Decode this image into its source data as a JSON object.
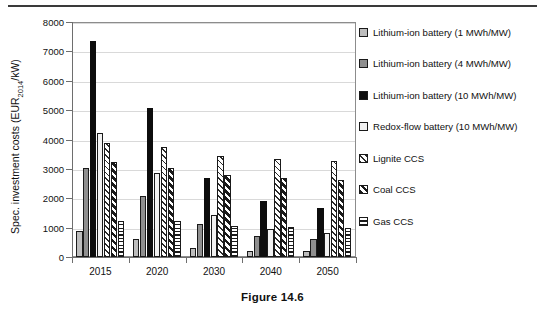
{
  "figure": {
    "caption": "Figure 14.6"
  },
  "chart_data": {
    "type": "bar",
    "title": "",
    "xlabel": "",
    "ylabel": "Spec. investment costs (EUR2014/kW)",
    "ylabel_prefix": "Spec. investment costs (EUR",
    "ylabel_sub": "2014",
    "ylabel_suffix": "/kW)",
    "ylim": [
      0,
      8000
    ],
    "ytick_step": 1000,
    "yticks": [
      "0",
      "1000",
      "2000",
      "3000",
      "4000",
      "5000",
      "6000",
      "7000",
      "8000"
    ],
    "grid": true,
    "legend_position": "right",
    "categories": [
      "2015",
      "2020",
      "2030",
      "2040",
      "2050"
    ],
    "series": [
      {
        "name": "Lithium-ion battery (1 MWh/MW)",
        "swatch": "light-gray-solid",
        "color": "#bdbdbd",
        "values": [
          880,
          610,
          320,
          215,
          190
        ]
      },
      {
        "name": "Lithium-ion battery (4 MWh/MW)",
        "swatch": "mid-gray-solid",
        "color": "#8f8f8f",
        "values": [
          3030,
          2090,
          1110,
          700,
          610
        ]
      },
      {
        "name": "Lithium-ion battery (10 MWh/MW)",
        "swatch": "black-solid",
        "color": "#0d0d0d",
        "values": [
          7360,
          5080,
          2680,
          1910,
          1680
        ]
      },
      {
        "name": "Redox-flow battery (10 MWh/MW)",
        "swatch": "white-solid",
        "color": "#f2f2f2",
        "values": [
          4220,
          2860,
          1430,
          940,
          830
        ]
      },
      {
        "name": "Lignite CCS",
        "swatch": "diagonal-light-hatch",
        "color": "#2b2b2b",
        "values": [
          3890,
          3750,
          3450,
          3340,
          3270
        ]
      },
      {
        "name": "Coal CCS",
        "swatch": "diagonal-dark-hatch",
        "color": "#1a1a1a",
        "values": [
          3250,
          3030,
          2780,
          2700,
          2630
        ]
      },
      {
        "name": "Gas CCS",
        "swatch": "horizontal-hatch",
        "color": "#1a1a1a",
        "values": [
          1210,
          1210,
          1050,
          1020,
          1000
        ]
      }
    ]
  }
}
